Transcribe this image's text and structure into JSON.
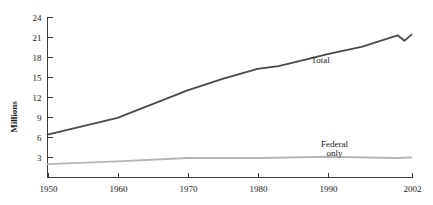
{
  "chart_data": {
    "type": "line",
    "title": "",
    "subtitle": "",
    "xlabel": "",
    "ylabel": "Millions",
    "xlim": [
      1950,
      2002
    ],
    "ylim": [
      0,
      24
    ],
    "grid": false,
    "legend_position": "inline-annotation",
    "x_ticks": [
      "1950",
      "1960",
      "1970",
      "1980",
      "1990",
      "2002"
    ],
    "x_tick_values": [
      1950,
      1960,
      1970,
      1980,
      1990,
      2002
    ],
    "y_ticks": [
      "3",
      "6",
      "9",
      "12",
      "15",
      "18",
      "21",
      "24"
    ],
    "y_tick_values": [
      3,
      6,
      9,
      12,
      15,
      18,
      21,
      24
    ],
    "series": [
      {
        "name": "Total",
        "color": "#4a4a4a",
        "label": "Total",
        "x": [
          1950,
          1960,
          1970,
          1975,
          1980,
          1983,
          1987,
          1990,
          1995,
          2000,
          2001,
          2002
        ],
        "values": [
          6.4,
          8.9,
          13.0,
          14.7,
          16.2,
          16.6,
          17.6,
          18.4,
          19.5,
          21.2,
          20.4,
          21.3
        ]
      },
      {
        "name": "Federal only",
        "color": "#b5b5b5",
        "label": "Federal\nonly",
        "label_line1": "Federal",
        "label_line2": "only",
        "x": [
          1950,
          1960,
          1970,
          1980,
          1990,
          2000,
          2002
        ],
        "values": [
          2.0,
          2.4,
          2.9,
          2.9,
          3.1,
          2.9,
          3.0
        ]
      }
    ],
    "annotations": [
      {
        "text": "Total",
        "x": 1989,
        "y": 17.0
      },
      {
        "text": "Federal",
        "x": 1991,
        "y": 4.6
      },
      {
        "text": "only",
        "x": 1991,
        "y": 3.2
      }
    ]
  },
  "colors": {
    "background": "#ffffff",
    "axis": "#3a3a3a",
    "text": "#1a1a1a",
    "total_series": "#4a4a4a",
    "federal_series": "#b5b5b5"
  }
}
